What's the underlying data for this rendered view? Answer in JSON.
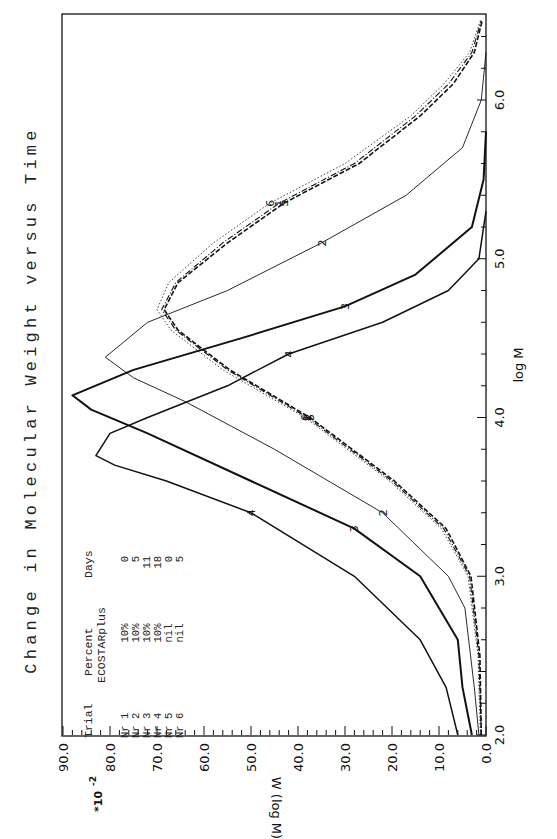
{
  "chart_data": {
    "type": "line",
    "title": "Change in Molecular Weight versus Time",
    "xlabel": "log M",
    "ylabel": "W (log M)",
    "y_multiplier_label": "*10",
    "y_multiplier_exp": "-2",
    "xlim": [
      2.0,
      6.5
    ],
    "ylim": [
      0.0,
      90.0
    ],
    "x_ticks": [
      "2.0",
      "3.0",
      "4.0",
      "5.0",
      "6.0"
    ],
    "x_tick_values": [
      2.0,
      3.0,
      4.0,
      5.0,
      6.0
    ],
    "y_ticks": [
      "0.0",
      "10.0",
      "20.0",
      "30.0",
      "40.0",
      "50.0",
      "60.0",
      "70.0",
      "80.0",
      "90.0"
    ],
    "y_tick_values": [
      0,
      10,
      20,
      30,
      40,
      50,
      60,
      70,
      80,
      90
    ],
    "grid": false,
    "orientation": "rotated-90-ccw",
    "legend": {
      "placement": "top-left",
      "headers": [
        "Trial",
        "Percent",
        "Days"
      ],
      "subheader": "ECOSTARplus",
      "rows": [
        {
          "trial": "Nr 1",
          "percent": "10%",
          "days": "0"
        },
        {
          "trial": "Nr 2",
          "percent": "10%",
          "days": "5"
        },
        {
          "trial": "Nr 3",
          "percent": "10%",
          "days": "11"
        },
        {
          "trial": "Nr 4",
          "percent": "10%",
          "days": "18"
        },
        {
          "trial": "Nr 5",
          "percent": "nil",
          "days": "0"
        },
        {
          "trial": "Nr 6",
          "percent": "nil",
          "days": "5"
        }
      ]
    },
    "series": [
      {
        "name": "1",
        "style": "dash-dot",
        "x": [
          2.0,
          2.5,
          3.0,
          3.3,
          3.6,
          4.0,
          4.3,
          4.55,
          4.68,
          4.85,
          5.1,
          5.35,
          5.6,
          5.9,
          6.1,
          6.3,
          6.5
        ],
        "y": [
          1,
          1.5,
          3.5,
          9,
          20,
          38,
          55,
          66,
          69,
          66,
          56,
          44,
          28,
          15,
          8,
          3,
          1
        ]
      },
      {
        "name": "2",
        "style": "thin",
        "x": [
          2.0,
          2.3,
          2.8,
          3.0,
          3.4,
          3.8,
          4.1,
          4.25,
          4.38,
          4.6,
          4.8,
          5.1,
          5.4,
          5.7,
          6.0,
          6.3
        ],
        "y": [
          1.5,
          2.5,
          4.5,
          8,
          22,
          45,
          64,
          75,
          81,
          72,
          55,
          35,
          17,
          5,
          1,
          0
        ]
      },
      {
        "name": "3",
        "style": "thick",
        "x": [
          2.0,
          2.3,
          2.6,
          3.0,
          3.3,
          3.6,
          3.9,
          4.05,
          4.14,
          4.3,
          4.5,
          4.7,
          4.9,
          5.2,
          5.5,
          5.8
        ],
        "y": [
          3,
          5,
          6,
          14,
          28,
          50,
          72,
          84,
          88,
          75,
          52,
          30,
          15,
          3,
          0.5,
          0
        ]
      },
      {
        "name": "4",
        "style": "medium",
        "x": [
          2.0,
          2.3,
          2.6,
          3.0,
          3.4,
          3.6,
          3.7,
          3.76,
          3.9,
          4.0,
          4.2,
          4.4,
          4.6,
          4.8,
          5.0,
          5.3
        ],
        "y": [
          6,
          8.5,
          14,
          28,
          50,
          68,
          79,
          83,
          80,
          72,
          55,
          42,
          22,
          8,
          1.5,
          0
        ]
      },
      {
        "name": "5",
        "style": "dashed",
        "x": [
          2.0,
          2.5,
          3.0,
          3.3,
          3.6,
          4.0,
          4.3,
          4.55,
          4.68,
          4.85,
          5.1,
          5.35,
          5.6,
          5.9,
          6.1,
          6.3,
          6.5
        ],
        "y": [
          1,
          1.3,
          3.2,
          8.5,
          19.5,
          37.5,
          54.5,
          65.5,
          68.5,
          65.5,
          55,
          43,
          27,
          14,
          7,
          2.5,
          0.8
        ]
      },
      {
        "name": "6",
        "style": "dotted",
        "x": [
          2.0,
          2.5,
          3.0,
          3.3,
          3.6,
          4.0,
          4.3,
          4.55,
          4.68,
          4.85,
          5.1,
          5.35,
          5.6,
          5.9,
          6.1,
          6.3,
          6.5
        ],
        "y": [
          1.2,
          1.7,
          3.8,
          9.5,
          20.5,
          38.5,
          56,
          67,
          70,
          67.5,
          58,
          46,
          30,
          16,
          9,
          3.5,
          1.2
        ]
      }
    ]
  }
}
